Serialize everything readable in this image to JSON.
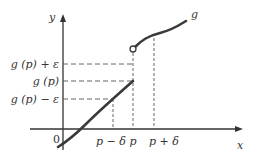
{
  "diagram": {
    "axes": {
      "x_label": "x",
      "y_label": "y",
      "origin_label": "0"
    },
    "curve_label": "g",
    "y_ticks": [
      {
        "id": "upper",
        "label": "g (p) + ε"
      },
      {
        "id": "mid",
        "label": "g (p)"
      },
      {
        "id": "lower",
        "label": "g (p) − ε"
      }
    ],
    "x_ticks": [
      {
        "id": "left",
        "label": "p − δ"
      },
      {
        "id": "mid",
        "label": "p"
      },
      {
        "id": "right",
        "label": "p + δ"
      }
    ],
    "colors": {
      "curve": "#3a3a3a",
      "axis": "#333333",
      "dashed": "#555555"
    }
  }
}
